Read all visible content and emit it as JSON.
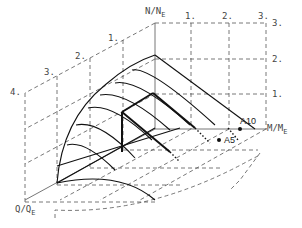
{
  "diagram": {
    "axes": {
      "n": {
        "label": "N/N",
        "sub": "E",
        "ticks": [
          "1.",
          "2.",
          "3."
        ]
      },
      "m": {
        "label": "M/M",
        "sub": "E",
        "ticks": [
          "1.",
          "2.",
          "3."
        ]
      },
      "q": {
        "label": "Q/Q",
        "sub": "E",
        "ticks": [
          "1.",
          "2.",
          "3.",
          "4."
        ]
      }
    },
    "points": [
      {
        "label": "A10"
      },
      {
        "label": "A5"
      }
    ],
    "colors": {
      "line": "#111111",
      "dashed": "#555555",
      "axis": "#666666"
    }
  }
}
